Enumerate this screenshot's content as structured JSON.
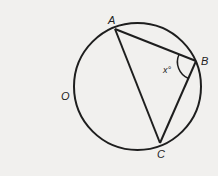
{
  "diagram": {
    "type": "geometry",
    "circle": {
      "center_label": "O",
      "cx": 137.5,
      "cy": 86.5,
      "r": 63.5
    },
    "points": [
      {
        "label": "A",
        "x": 115,
        "y": 29,
        "label_x": 108,
        "label_y": 24
      },
      {
        "label": "B",
        "x": 196,
        "y": 61,
        "label_x": 201,
        "label_y": 65
      },
      {
        "label": "C",
        "x": 160,
        "y": 143,
        "label_x": 157,
        "label_y": 158
      }
    ],
    "center": {
      "label": "O",
      "label_x": 61,
      "label_y": 100
    },
    "segments": [
      [
        "A",
        "B"
      ],
      [
        "B",
        "C"
      ],
      [
        "C",
        "A"
      ]
    ],
    "angle": {
      "vertex": "B",
      "label": "x°",
      "label_x": 163,
      "label_y": 73
    },
    "colors": {
      "stroke": "#1e1e1e",
      "background": "#f1f0ee"
    }
  }
}
